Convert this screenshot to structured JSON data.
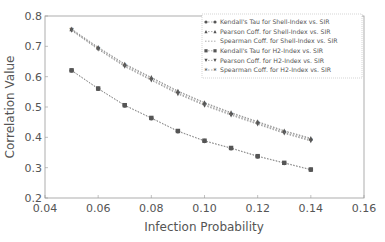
{
  "chart_data": {
    "type": "line",
    "title": "",
    "xlabel": "Infection Probability",
    "ylabel": "Correlation Value",
    "xlim": [
      0.04,
      0.16
    ],
    "ylim": [
      0.2,
      0.8
    ],
    "xticks": [
      "0.04",
      "0.06",
      "0.08",
      "0.10",
      "0.12",
      "0.14",
      "0.16"
    ],
    "yticks": [
      "0.2",
      "0.3",
      "0.4",
      "0.5",
      "0.6",
      "0.7",
      "0.8"
    ],
    "grid": false,
    "legend_position": "upper right",
    "x": [
      0.05,
      0.06,
      0.07,
      0.08,
      0.09,
      0.1,
      0.11,
      0.12,
      0.13,
      0.14
    ],
    "series": [
      {
        "name": "Kendall's Tau for Shell-Index vs. SIR",
        "marker": "circle",
        "values": [
          0.62,
          0.56,
          0.505,
          0.463,
          0.42,
          0.388,
          0.364,
          0.337,
          0.315,
          0.293
        ]
      },
      {
        "name": "Pearson Coff. for Shell-Index vs. SIR",
        "marker": "triangle-up",
        "values": [
          0.757,
          0.697,
          0.642,
          0.598,
          0.553,
          0.515,
          0.482,
          0.452,
          0.422,
          0.397
        ]
      },
      {
        "name": "Spearman Coff. for Shell-Index vs. SIR",
        "marker": "none",
        "values": [
          0.755,
          0.695,
          0.64,
          0.596,
          0.551,
          0.513,
          0.48,
          0.45,
          0.42,
          0.395
        ]
      },
      {
        "name": "Kendall's Tau for H2-Index vs. SIR",
        "marker": "square",
        "values": [
          0.621,
          0.561,
          0.506,
          0.464,
          0.421,
          0.389,
          0.365,
          0.338,
          0.316,
          0.294
        ]
      },
      {
        "name": "Pearson Coff. for H2-Index vs. SIR",
        "marker": "triangle-down",
        "values": [
          0.752,
          0.69,
          0.633,
          0.588,
          0.543,
          0.505,
          0.473,
          0.443,
          0.413,
          0.388
        ]
      },
      {
        "name": "Spearman Coff. for H2-Index vs. SIR",
        "marker": "star",
        "values": [
          0.754,
          0.692,
          0.636,
          0.591,
          0.546,
          0.508,
          0.476,
          0.446,
          0.416,
          0.391
        ]
      }
    ]
  },
  "legend": {
    "items": [
      "Kendall's Tau for Shell-Index vs. SIR",
      "Pearson Coff. for Shell-Index vs. SIR",
      "Spearman Coff. for Shell-Index vs. SIR",
      "Kendall's Tau for H2-Index vs. SIR",
      "Pearson Coff. for H2-Index vs. SIR",
      "Spearman Coff. for H2-Index vs. SIR"
    ]
  },
  "colors": {
    "axis": "#888888",
    "series": "#555555",
    "text": "#555555"
  }
}
